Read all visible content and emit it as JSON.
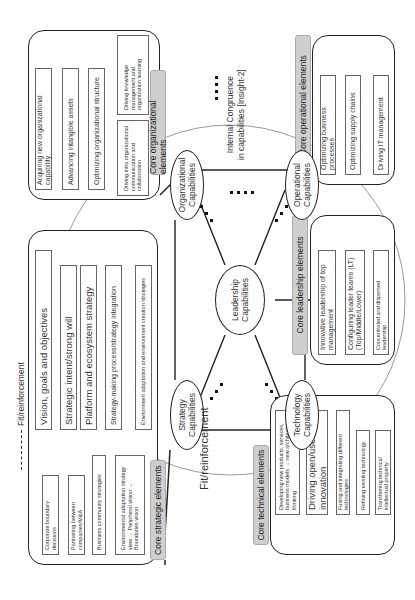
{
  "legend": {
    "dashed_label": "Fit/reinforcement"
  },
  "center": {
    "title": "Fit/reinforcement",
    "internal_congruence": "Internal Congruence",
    "internal_congruence_2": "in capabilities [Insight-2]",
    "capabilities": {
      "leadership": "Leadership Capabilities",
      "organizational": "Organizational Capabilities",
      "operational": "Operational Capabilities",
      "technology": "Technology Capabilities",
      "strategy": "Strategy Capabilities"
    }
  },
  "groups": {
    "organizational": {
      "tag": "Core organizational elements",
      "items": [
        "Acquiring new organizational capability",
        "Advancing intangible assets",
        "Optimizing organizational structure",
        "Driving knowledge management and organization learning",
        "Driving intra organizational communication and collaboration"
      ]
    },
    "operational": {
      "tag": "Core operational elements",
      "items": [
        "Optimizing business processes",
        "Optimizing supply chains",
        "Driving IT management"
      ]
    },
    "leadership": {
      "tag": "Core leadership elements",
      "items": [
        "Innovative leadership of top management",
        "Configuring leader teams (LT) (Top/Middle/Lower)",
        "Concentrated and dispersed leadership"
      ]
    },
    "strategic": {
      "tag": "Core strategic elements",
      "items": [
        "Vision, goals and objectives",
        "Strategic intent/strong will",
        "Platform and ecosystem strategy",
        "Strategy-making process/strategy integration",
        "Environment adaptation and environment creation strategies"
      ],
      "sub_items": [
        "Corporate boundary decisions",
        "Partnering between companies/M&A",
        "Business community strategies",
        "Environmental adaptation strategy view → Peripheral vision → Boundaries vision"
      ]
    },
    "technical": {
      "tag": "Core technical elements",
      "items": [
        "Developing new products, services, business models → new architecture thinking",
        "Driving open/user innovation",
        "Fusing and integrating different technologies",
        "Refining existing technology",
        "Transferring technical intellectual property"
      ]
    }
  },
  "colors": {
    "tag_bg": "#cfcfcf",
    "border": "#222222",
    "circle": "#999999"
  }
}
